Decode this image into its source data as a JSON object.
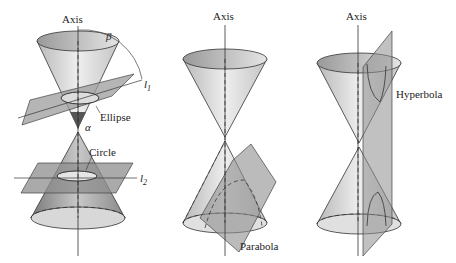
{
  "figure": {
    "panels": [
      {
        "id": "ellipse-circle",
        "axis_label": "Axis",
        "beta_label": "β",
        "alpha_label": "α",
        "l1_label": "l",
        "l1_sub": "1",
        "l2_label": "l",
        "l2_sub": "2",
        "ellipse_label": "Ellipse",
        "circle_label": "Circle"
      },
      {
        "id": "parabola",
        "axis_label": "Axis",
        "parabola_label": "Parabola"
      },
      {
        "id": "hyperbola",
        "axis_label": "Axis",
        "hyperbola_label": "Hyperbola"
      }
    ]
  }
}
